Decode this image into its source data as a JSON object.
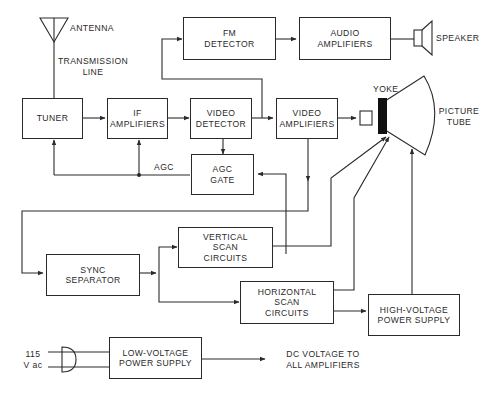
{
  "diagram": {
    "blocks": {
      "tuner": "TUNER",
      "if_amplifiers": "IF\nAMPLIFIERS",
      "video_detector": "VIDEO\nDETECTOR",
      "video_amplifiers": "VIDEO\nAMPLIFIERS",
      "fm_detector": "FM\nDETECTOR",
      "audio_amplifiers": "AUDIO\nAMPLIFIERS",
      "agc_gate": "AGC\nGATE",
      "sync_separator": "SYNC\nSEPARATOR",
      "vertical_scan": "VERTICAL\nSCAN\nCIRCUITS",
      "horizontal_scan": "HORIZONTAL\nSCAN\nCIRCUITS",
      "high_voltage_supply": "HIGH-VOLTAGE\nPOWER SUPPLY",
      "low_voltage_supply": "LOW-VOLTAGE\nPOWER SUPPLY"
    },
    "labels": {
      "antenna": "ANTENNA",
      "transmission_line": "TRANSMISSION\nLINE",
      "speaker": "SPEAKER",
      "yoke": "YOKE",
      "picture_tube": "PICTURE\nTUBE",
      "agc": "AGC",
      "ac_input": "115\nV ac",
      "dc_output": "DC VOLTAGE TO\nALL AMPLIFIERS"
    },
    "colors": {
      "line": "#2a2a2a",
      "background": "#ffffff",
      "yoke_fill": "#111111"
    }
  }
}
